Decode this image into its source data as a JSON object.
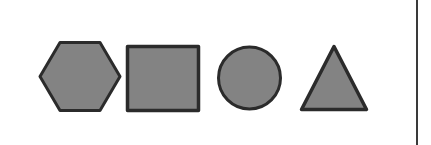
{
  "figure": {
    "background_color": "#ffffff",
    "width": 431,
    "height": 145,
    "shape_fill_color": "#838383",
    "shape_outline_color": "#2b2b2b",
    "outline_width": 3
  },
  "shapes": [
    {
      "name": "hexagon",
      "label": "Hexagon",
      "sides": 6,
      "orientation": "flat-top",
      "bounds": {
        "x": 38,
        "y": 42,
        "width": 84,
        "height": 69
      },
      "points": "40,76.5 60,42.5 100,42.5 120,76.5 100,110.5 60,110.5"
    },
    {
      "name": "square",
      "label": "Square",
      "sides": 4,
      "orientation": "axis-aligned",
      "bounds": {
        "x": 126,
        "y": 45,
        "width": 74,
        "height": 67
      },
      "points": "127.5,46.5 198.5,46.5 198.5,110.5 127.5,110.5"
    },
    {
      "name": "circle",
      "label": "Circle",
      "sides": 0,
      "orientation": "n/a",
      "bounds": {
        "x": 217,
        "y": 46,
        "width": 65,
        "height": 64
      },
      "center": {
        "cx": 249.5,
        "cy": 78
      },
      "radius": 31
    },
    {
      "name": "triangle",
      "label": "Triangle",
      "sides": 3,
      "orientation": "apex-up",
      "bounds": {
        "x": 300,
        "y": 45,
        "width": 68,
        "height": 66
      },
      "points": "334,46.5 366.5,109.5 301.5,109.5"
    }
  ],
  "divider": {
    "name": "vertical-divider",
    "color": "#3a3a3a",
    "x": 416,
    "width": 2
  }
}
